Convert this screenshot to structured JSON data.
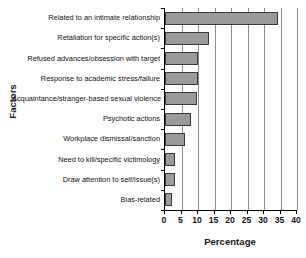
{
  "chart_data": {
    "type": "bar",
    "orientation": "horizontal",
    "title": "",
    "xlabel": "Percentage",
    "ylabel": "Factors",
    "xlim": [
      0,
      40
    ],
    "ylim": null,
    "grid": true,
    "legend": null,
    "xticks": [
      0,
      5,
      10,
      15,
      20,
      25,
      30,
      35,
      40
    ],
    "xticklabels": [
      "0",
      "5",
      "10",
      "15",
      "20",
      "25",
      "30",
      "35",
      "40"
    ],
    "categories": [
      "Related to an intimate relationship",
      "Retaliation for specific action(s)",
      "Refused advances/obsession with target",
      "Response to academic stress/failure",
      "Acquaintance/stranger-based sexual violence",
      "Psychotic actions",
      "Workplace dismissal/sanction",
      "Need to kill/specific victimology",
      "Draw attention to self/issue(s)",
      "Bias-related"
    ],
    "values": [
      34.2,
      13.3,
      10.0,
      10.0,
      9.7,
      7.8,
      6.2,
      3.0,
      3.0,
      2.0
    ],
    "bar_color": "#9a9a9a",
    "bar_edge_color": "#3a3a3a",
    "grid_color": "#8d8d8d",
    "axis_color": "#000000"
  }
}
